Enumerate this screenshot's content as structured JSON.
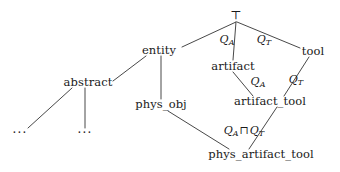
{
  "diagram": {
    "type": "lattice-taxonomy",
    "title": "",
    "background_color": "#ffffff",
    "line_color": "#333333",
    "text_color": "#1a1a1a",
    "width": 340,
    "height": 172,
    "nodes": [
      {
        "id": "top",
        "label": "⊤",
        "x": 236,
        "y": 15
      },
      {
        "id": "entity",
        "label": "entity",
        "x": 159,
        "y": 51
      },
      {
        "id": "tool",
        "label": "tool",
        "x": 313,
        "y": 52
      },
      {
        "id": "artifact",
        "label": "artifact",
        "x": 233,
        "y": 67
      },
      {
        "id": "abstract",
        "label": "abstract",
        "x": 88,
        "y": 83
      },
      {
        "id": "artifact_tool",
        "label": "artifact_tool",
        "x": 270,
        "y": 102
      },
      {
        "id": "phys_obj",
        "label": "phys_obj",
        "x": 161,
        "y": 105
      },
      {
        "id": "dots_left",
        "label": "···",
        "x": 20,
        "y": 133
      },
      {
        "id": "dots_right",
        "label": "···",
        "x": 85,
        "y": 133
      },
      {
        "id": "phys_artifact_tool",
        "label": "phys_artifact_tool",
        "x": 261,
        "y": 155
      }
    ],
    "edges": [
      {
        "from": "top",
        "to": "entity",
        "x1": 236,
        "y1": 22,
        "x2": 182,
        "y2": 47
      },
      {
        "from": "top",
        "to": "artifact",
        "x1": 236,
        "y1": 22,
        "x2": 233,
        "y2": 60
      },
      {
        "from": "top",
        "to": "tool",
        "x1": 237,
        "y1": 22,
        "x2": 300,
        "y2": 48
      },
      {
        "from": "entity",
        "to": "abstract",
        "x1": 146,
        "y1": 56,
        "x2": 113,
        "y2": 81
      },
      {
        "from": "entity",
        "to": "phys_obj",
        "x1": 161,
        "y1": 56,
        "x2": 161,
        "y2": 99
      },
      {
        "from": "abstract",
        "to": "dots_left",
        "x1": 72,
        "y1": 88,
        "x2": 28,
        "y2": 128
      },
      {
        "from": "abstract",
        "to": "dots_right",
        "x1": 85,
        "y1": 88,
        "x2": 85,
        "y2": 128
      },
      {
        "from": "artifact",
        "to": "artifact_tool",
        "x1": 233,
        "y1": 72,
        "x2": 253,
        "y2": 96
      },
      {
        "from": "tool",
        "to": "artifact_tool",
        "x1": 309,
        "y1": 57,
        "x2": 284,
        "y2": 96
      },
      {
        "from": "phys_obj",
        "to": "phys_artifact_tool",
        "x1": 168,
        "y1": 111,
        "x2": 229,
        "y2": 149
      },
      {
        "from": "artifact_tool",
        "to": "phys_artifact_tool",
        "x1": 277,
        "y1": 107,
        "x2": 249,
        "y2": 149
      }
    ],
    "edge_labels": [
      {
        "id": "qa_top",
        "base": "Q",
        "sub": "A",
        "meet": "",
        "x": 227,
        "y": 40
      },
      {
        "id": "qt_top",
        "base": "Q",
        "sub": "T",
        "meet": "",
        "x": 264,
        "y": 40
      },
      {
        "id": "qa_mid",
        "base": "Q",
        "sub": "A",
        "meet": "",
        "x": 258,
        "y": 82
      },
      {
        "id": "qt_mid",
        "base": "Q",
        "sub": "T",
        "meet": "",
        "x": 296,
        "y": 80
      },
      {
        "id": "qa_qt_bot",
        "base": "Q",
        "sub": "A",
        "meet": "⊓",
        "base2": "Q",
        "sub2": "T",
        "x": 244,
        "y": 131
      }
    ]
  }
}
